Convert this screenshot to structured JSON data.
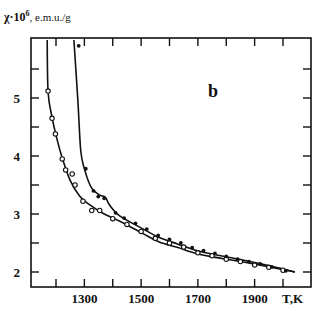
{
  "chart_data": {
    "type": "line",
    "title": "",
    "panel_label": "b",
    "xlabel": "T,K",
    "ylabel": "χ·10⁶, e.m.u./g",
    "ylabel_parts": {
      "symbol": "χ·10",
      "exponent": "6",
      "unit": ", e.m.u./g"
    },
    "xlim": [
      1165,
      2100
    ],
    "ylim": [
      1.75,
      6.05
    ],
    "x_ticks": [
      1200,
      1300,
      1400,
      1500,
      1600,
      1700,
      1800,
      1900,
      2000
    ],
    "x_tick_labels": [
      "1300",
      "1500",
      "1700",
      "1900"
    ],
    "x_tick_labels_at": [
      1300,
      1500,
      1700,
      1900
    ],
    "y_ticks": [
      2,
      2.5,
      3,
      3.5,
      4,
      4.5,
      5,
      5.5
    ],
    "y_tick_labels": [
      "2",
      "3",
      "4",
      "5"
    ],
    "y_tick_labels_at": [
      2,
      3,
      4,
      5
    ],
    "grid": false,
    "legend": null,
    "series": [
      {
        "name": "lower curve (open circles)",
        "marker": "open-circle",
        "curve": [
          [
            1169,
            6.0
          ],
          [
            1172,
            5.1
          ],
          [
            1186,
            4.67
          ],
          [
            1200,
            4.36
          ],
          [
            1221,
            3.98
          ],
          [
            1249,
            3.59
          ],
          [
            1283,
            3.31
          ],
          [
            1318,
            3.16
          ],
          [
            1370,
            3.0
          ],
          [
            1423,
            2.88
          ],
          [
            1500,
            2.68
          ],
          [
            1562,
            2.52
          ],
          [
            1630,
            2.42
          ],
          [
            1701,
            2.31
          ],
          [
            1790,
            2.23
          ],
          [
            1875,
            2.16
          ],
          [
            1960,
            2.08
          ],
          [
            2042,
            2.0
          ]
        ],
        "points": [
          [
            1172,
            5.12
          ],
          [
            1186,
            4.65
          ],
          [
            1198,
            4.38
          ],
          [
            1222,
            3.95
          ],
          [
            1234,
            3.76
          ],
          [
            1257,
            3.69
          ],
          [
            1267,
            3.5
          ],
          [
            1295,
            3.22
          ],
          [
            1326,
            3.06
          ],
          [
            1354,
            3.06
          ],
          [
            1400,
            2.92
          ],
          [
            1450,
            2.82
          ],
          [
            1500,
            2.7
          ],
          [
            1550,
            2.58
          ],
          [
            1600,
            2.5
          ],
          [
            1650,
            2.43
          ],
          [
            1700,
            2.33
          ],
          [
            1750,
            2.28
          ],
          [
            1800,
            2.22
          ],
          [
            1850,
            2.18
          ],
          [
            1900,
            2.12
          ],
          [
            1950,
            2.08
          ],
          [
            2000,
            2.03
          ]
        ]
      },
      {
        "name": "upper curve (filled circles)",
        "marker": "filled-circle",
        "curve": [
          [
            1263,
            6.0
          ],
          [
            1277,
            4.97
          ],
          [
            1287,
            4.1
          ],
          [
            1301,
            3.76
          ],
          [
            1325,
            3.45
          ],
          [
            1353,
            3.33
          ],
          [
            1374,
            3.29
          ],
          [
            1388,
            3.16
          ],
          [
            1423,
            2.97
          ],
          [
            1500,
            2.76
          ],
          [
            1562,
            2.6
          ],
          [
            1630,
            2.48
          ],
          [
            1701,
            2.36
          ],
          [
            1790,
            2.27
          ],
          [
            1875,
            2.19
          ],
          [
            1960,
            2.1
          ],
          [
            2042,
            2.0
          ]
        ],
        "points": [
          [
            1280,
            5.9
          ],
          [
            1305,
            3.78
          ],
          [
            1332,
            3.4
          ],
          [
            1349,
            3.3
          ],
          [
            1370,
            3.27
          ],
          [
            1410,
            3.02
          ],
          [
            1440,
            2.93
          ],
          [
            1480,
            2.84
          ],
          [
            1520,
            2.74
          ],
          [
            1560,
            2.63
          ],
          [
            1600,
            2.56
          ],
          [
            1640,
            2.5
          ],
          [
            1680,
            2.42
          ],
          [
            1720,
            2.37
          ],
          [
            1760,
            2.32
          ],
          [
            1800,
            2.27
          ],
          [
            1840,
            2.22
          ],
          [
            1880,
            2.18
          ],
          [
            1920,
            2.14
          ],
          [
            1960,
            2.09
          ],
          [
            2010,
            2.02
          ]
        ]
      }
    ]
  }
}
